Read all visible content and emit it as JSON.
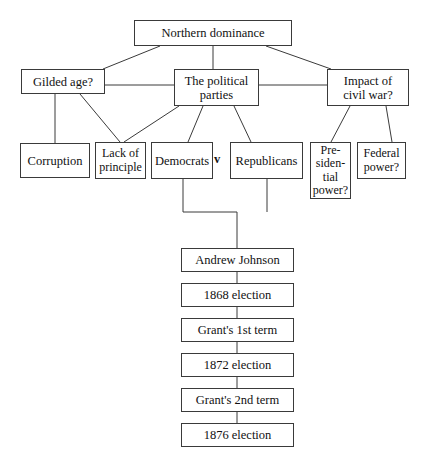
{
  "diagram": {
    "background_color": "#ffffff",
    "line_color": "#3a3a3a",
    "text_color": "#111111",
    "separator_label": "v",
    "nodes": [
      {
        "id": "northern-dominance",
        "label": "Northern dominance",
        "x": 134,
        "y": 20,
        "w": 158,
        "h": 26
      },
      {
        "id": "gilded-age",
        "label": "Gilded age?",
        "x": 21,
        "y": 69,
        "w": 84,
        "h": 25
      },
      {
        "id": "political-parties",
        "label": "The political\nparties",
        "x": 174,
        "y": 69,
        "w": 85,
        "h": 37
      },
      {
        "id": "impact-civil-war",
        "label": "Impact of\ncivil war?",
        "x": 327,
        "y": 69,
        "w": 82,
        "h": 37
      },
      {
        "id": "corruption",
        "label": "Corruption",
        "x": 20,
        "y": 143,
        "w": 70,
        "h": 35
      },
      {
        "id": "lack-of-principle",
        "label": "Lack of\nprinciple",
        "x": 95,
        "y": 142,
        "w": 51,
        "h": 37
      },
      {
        "id": "democrats",
        "label": "Democrats",
        "x": 151,
        "y": 142,
        "w": 62,
        "h": 37
      },
      {
        "id": "republicans",
        "label": "Republicans",
        "x": 230,
        "y": 142,
        "w": 73,
        "h": 37
      },
      {
        "id": "presidential-power",
        "label": "Pre-\nsiden-\ntial\npower?",
        "x": 310,
        "y": 142,
        "w": 41,
        "h": 57
      },
      {
        "id": "federal-power",
        "label": "Federal\npower?",
        "x": 357,
        "y": 142,
        "w": 49,
        "h": 37
      },
      {
        "id": "andrew-johnson",
        "label": "Andrew Johnson",
        "x": 181,
        "y": 248,
        "w": 113,
        "h": 24
      },
      {
        "id": "election-1868",
        "label": "1868 election",
        "x": 181,
        "y": 283,
        "w": 113,
        "h": 24
      },
      {
        "id": "grants-1st-term",
        "label": "Grant's 1st term",
        "x": 181,
        "y": 318,
        "w": 113,
        "h": 24
      },
      {
        "id": "election-1872",
        "label": "1872 election",
        "x": 181,
        "y": 353,
        "w": 113,
        "h": 24
      },
      {
        "id": "grants-2nd-term",
        "label": "Grant's 2nd term",
        "x": 181,
        "y": 388,
        "w": 113,
        "h": 24
      },
      {
        "id": "election-1876",
        "label": "1876 election",
        "x": 181,
        "y": 423,
        "w": 113,
        "h": 24
      }
    ],
    "edges": [
      {
        "from": "northern-dominance",
        "to": "gilded-age",
        "points": "160,46 103,69"
      },
      {
        "from": "northern-dominance",
        "to": "political-parties",
        "points": "213,46 213,69"
      },
      {
        "from": "northern-dominance",
        "to": "impact-civil-war",
        "points": "266,46 331,69"
      },
      {
        "from": "gilded-age",
        "to": "political-parties",
        "points": "105,85 174,85"
      },
      {
        "from": "political-parties",
        "to": "impact-civil-war",
        "points": "259,85 327,85"
      },
      {
        "from": "gilded-age",
        "to": "corruption",
        "points": "55,94 55,143"
      },
      {
        "from": "gilded-age",
        "to": "lack-of-principle",
        "points": "80,94 120,142"
      },
      {
        "from": "political-parties",
        "to": "lack-of-principle",
        "points": "179,106 124,142"
      },
      {
        "from": "political-parties",
        "to": "democrats",
        "points": "203,106 188,142"
      },
      {
        "from": "political-parties",
        "to": "republicans",
        "points": "234,106 251,142"
      },
      {
        "from": "impact-civil-war",
        "to": "presidential-power",
        "points": "350,106 331,142"
      },
      {
        "from": "impact-civil-war",
        "to": "federal-power",
        "points": "386,106 392,142"
      },
      {
        "from": "democrats",
        "to": "andrew-johnson",
        "points": "183,179 183,212 237,212 237,248"
      },
      {
        "from": "republicans",
        "to": "andrew-johnson",
        "points": "267,179 267,212"
      },
      {
        "from": "andrew-johnson",
        "to": "election-1868",
        "points": "237,272 237,283"
      },
      {
        "from": "election-1868",
        "to": "grants-1st-term",
        "points": "237,307 237,318"
      },
      {
        "from": "grants-1st-term",
        "to": "election-1872",
        "points": "237,342 237,353"
      },
      {
        "from": "election-1872",
        "to": "grants-2nd-term",
        "points": "237,377 237,388"
      },
      {
        "from": "grants-2nd-term",
        "to": "election-1876",
        "points": "237,412 237,423"
      }
    ],
    "separator": {
      "label": "v",
      "x": 214,
      "y": 153
    }
  }
}
